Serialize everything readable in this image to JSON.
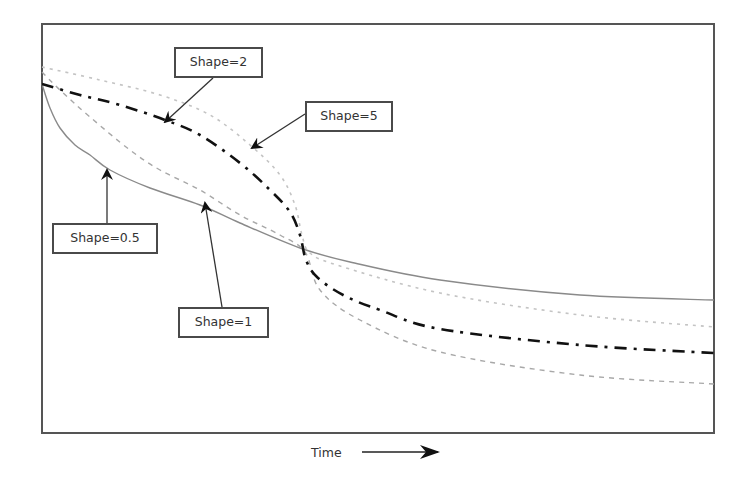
{
  "chart_data": {
    "type": "line",
    "title": "",
    "xlabel": "Time",
    "ylabel": "",
    "grid": false,
    "legend": "none (callout labels with arrows)",
    "x_ticks": [],
    "y_ticks": [],
    "x_range_px": [
      42,
      714
    ],
    "y_range_px": [
      24,
      433
    ],
    "series": [
      {
        "name": "Shape=0.5",
        "style": "solid",
        "color": "#8a8a8a",
        "points_px": [
          [
            42,
            84
          ],
          [
            50,
            108
          ],
          [
            60,
            128
          ],
          [
            75,
            145
          ],
          [
            90,
            155
          ],
          [
            110,
            170
          ],
          [
            150,
            188
          ],
          [
            200,
            205
          ],
          [
            240,
            223
          ],
          [
            300,
            248
          ],
          [
            350,
            262
          ],
          [
            440,
            280
          ],
          [
            580,
            295
          ],
          [
            714,
            300
          ]
        ]
      },
      {
        "name": "Shape=1",
        "style": "dashed",
        "color": "#a8a8a8",
        "points_px": [
          [
            42,
            72
          ],
          [
            60,
            90
          ],
          [
            90,
            117
          ],
          [
            130,
            150
          ],
          [
            160,
            170
          ],
          [
            200,
            190
          ],
          [
            240,
            215
          ],
          [
            280,
            235
          ],
          [
            305,
            252
          ],
          [
            320,
            290
          ],
          [
            360,
            320
          ],
          [
            440,
            352
          ],
          [
            580,
            375
          ],
          [
            714,
            384
          ]
        ]
      },
      {
        "name": "Shape=2",
        "style": "dash-dot",
        "color": "#111111",
        "points_px": [
          [
            42,
            84
          ],
          [
            80,
            95
          ],
          [
            120,
            105
          ],
          [
            165,
            120
          ],
          [
            200,
            135
          ],
          [
            240,
            163
          ],
          [
            270,
            190
          ],
          [
            290,
            212
          ],
          [
            300,
            235
          ],
          [
            306,
            260
          ],
          [
            318,
            278
          ],
          [
            345,
            296
          ],
          [
            380,
            310
          ],
          [
            440,
            329
          ],
          [
            580,
            345
          ],
          [
            714,
            353
          ]
        ]
      },
      {
        "name": "Shape=5",
        "style": "dotted",
        "color": "#c4c4c4",
        "points_px": [
          [
            42,
            67
          ],
          [
            100,
            80
          ],
          [
            160,
            95
          ],
          [
            210,
            115
          ],
          [
            250,
            145
          ],
          [
            280,
            175
          ],
          [
            295,
            205
          ],
          [
            302,
            235
          ],
          [
            310,
            253
          ],
          [
            340,
            266
          ],
          [
            440,
            293
          ],
          [
            580,
            315
          ],
          [
            714,
            327
          ]
        ]
      }
    ],
    "annotations": [
      {
        "text": "Shape=2",
        "box": [
          174,
          47,
          89,
          31
        ],
        "arrow_from": [
          213,
          78
        ],
        "arrow_to": [
          165,
          122
        ]
      },
      {
        "text": "Shape=5",
        "box": [
          305,
          101,
          88,
          31
        ],
        "arrow_from": [
          305,
          114
        ],
        "arrow_to": [
          252,
          148
        ]
      },
      {
        "text": "Shape=0.5",
        "box": [
          52,
          223,
          106,
          31
        ],
        "arrow_from": [
          107,
          223
        ],
        "arrow_to": [
          107,
          170
        ]
      },
      {
        "text": "Shape=1",
        "box": [
          178,
          307,
          91,
          31
        ],
        "arrow_from": [
          222,
          307
        ],
        "arrow_to": [
          205,
          203
        ]
      }
    ]
  },
  "labels": {
    "shape2": "Shape=2",
    "shape5": "Shape=5",
    "shape05": "Shape=0.5",
    "shape1": "Shape=1",
    "xaxis": "Time"
  }
}
